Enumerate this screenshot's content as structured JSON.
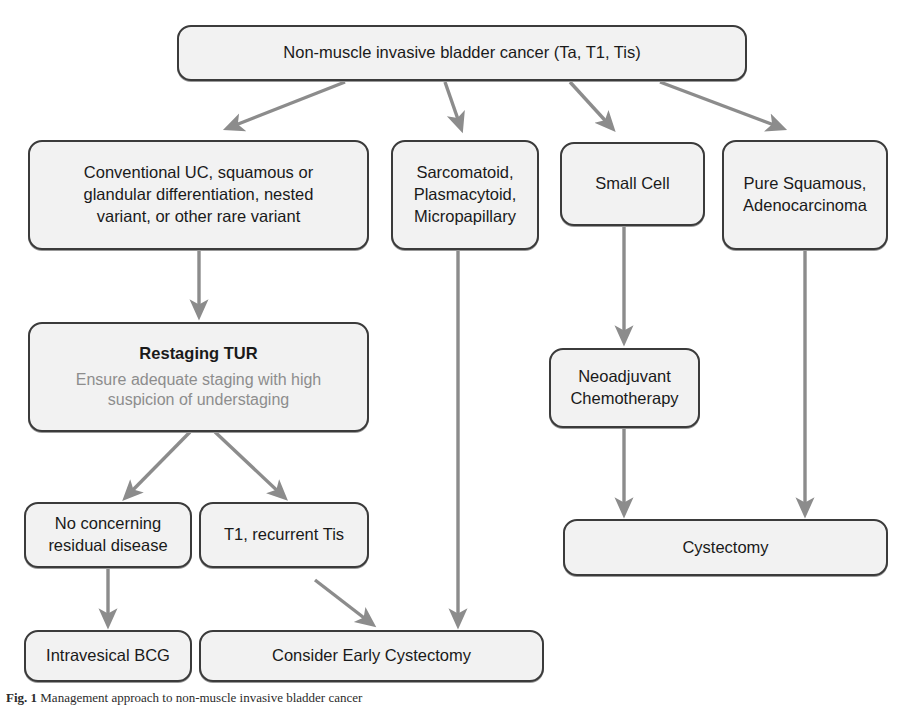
{
  "diagram": {
    "arrow_color": "#8c8c8c",
    "box_fill": "#f2f2f2",
    "box_border": "#3b3b3b",
    "text_color": "#1a1a1a",
    "muted_text_color": "#8d8d8d"
  },
  "nodes": {
    "root": {
      "id": "root",
      "label": "Non-muscle invasive bladder cancer (Ta, T1, Tis)",
      "lines": [
        "Non-muscle invasive bladder cancer (Ta, T1, Tis)"
      ]
    },
    "conventional": {
      "id": "conventional",
      "label": "Conventional UC, squamous or glandular differentiation, nested variant, or other rare variant",
      "line1": "Conventional UC, squamous or",
      "line2": "glandular differentiation, nested",
      "line3": "variant, or other rare variant"
    },
    "sarcomatoid": {
      "id": "sarcomatoid",
      "label": "Sarcomatoid, Plasmacytoid, Micropapillary",
      "line1": "Sarcomatoid,",
      "line2": "Plasmacytoid,",
      "line3": "Micropapillary"
    },
    "small_cell": {
      "id": "small_cell",
      "label": "Small Cell",
      "line1": "Small Cell"
    },
    "pure_squamous": {
      "id": "pure_squamous",
      "label": "Pure Squamous, Adenocarcinoma",
      "line1": "Pure Squamous,",
      "line2": "Adenocarcinoma"
    },
    "restaging_tur": {
      "id": "restaging_tur",
      "title": "Restaging TUR",
      "sub_line1": "Ensure adequate staging with high",
      "sub_line2": "suspicion of understaging"
    },
    "no_residual": {
      "id": "no_residual",
      "label": "No concerning residual disease",
      "line1": "No concerning",
      "line2": "residual disease"
    },
    "t1_recurrent": {
      "id": "t1_recurrent",
      "label": "T1, recurrent Tis",
      "line1": "T1, recurrent Tis"
    },
    "neoadjuvant": {
      "id": "neoadjuvant",
      "label": "Neoadjuvant Chemotherapy",
      "line1": "Neoadjuvant",
      "line2": "Chemotherapy"
    },
    "intravesical_bcg": {
      "id": "intravesical_bcg",
      "label": "Intravesical BCG",
      "line1": "Intravesical BCG"
    },
    "consider_early_cystectomy": {
      "id": "consider_early_cystectomy",
      "label": "Consider Early Cystectomy",
      "line1": "Consider Early Cystectomy"
    },
    "cystectomy": {
      "id": "cystectomy",
      "label": "Cystectomy",
      "line1": "Cystectomy"
    }
  },
  "edges": [
    {
      "from": "root",
      "to": "conventional"
    },
    {
      "from": "root",
      "to": "sarcomatoid"
    },
    {
      "from": "root",
      "to": "small_cell"
    },
    {
      "from": "root",
      "to": "pure_squamous"
    },
    {
      "from": "conventional",
      "to": "restaging_tur"
    },
    {
      "from": "restaging_tur",
      "to": "no_residual"
    },
    {
      "from": "restaging_tur",
      "to": "t1_recurrent"
    },
    {
      "from": "no_residual",
      "to": "intravesical_bcg"
    },
    {
      "from": "t1_recurrent",
      "to": "consider_early_cystectomy"
    },
    {
      "from": "sarcomatoid",
      "to": "consider_early_cystectomy"
    },
    {
      "from": "small_cell",
      "to": "neoadjuvant"
    },
    {
      "from": "neoadjuvant",
      "to": "cystectomy"
    },
    {
      "from": "pure_squamous",
      "to": "cystectomy"
    }
  ],
  "caption": {
    "figure_label": "Fig. 1",
    "text": "Management approach to non-muscle invasive bladder cancer"
  }
}
